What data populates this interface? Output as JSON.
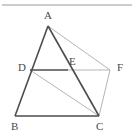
{
  "figure": {
    "canvas": {
      "width": 134,
      "height": 140,
      "background": "#ffffff"
    },
    "colors": {
      "primary_stroke": "#4d4d4d",
      "secondary_stroke": "#b4b4b4",
      "top_rule": "#9a9a9a",
      "label_text": "#4a4a4a"
    },
    "top_rule": {
      "x1": 2,
      "y1": 5,
      "x2": 132,
      "y2": 5
    },
    "points": [
      {
        "id": "A",
        "label": "A",
        "x": 48,
        "y": 26,
        "label_x": 44,
        "label_y": 10
      },
      {
        "id": "B",
        "label": "B",
        "x": 15,
        "y": 116,
        "label_x": 11,
        "label_y": 121
      },
      {
        "id": "C",
        "label": "C",
        "x": 99,
        "y": 116,
        "label_x": 96,
        "label_y": 121
      },
      {
        "id": "D",
        "label": "D",
        "x": 30,
        "y": 70,
        "label_x": 18,
        "label_y": 62
      },
      {
        "id": "E",
        "label": "E",
        "x": 68,
        "y": 70,
        "label_x": 69,
        "label_y": 56
      },
      {
        "id": "F",
        "label": "F",
        "x": 110,
        "y": 70,
        "label_x": 117,
        "label_y": 62
      }
    ],
    "segments": [
      {
        "id": "AB",
        "from": "A",
        "to": "B",
        "style": "primary",
        "width": 1.6
      },
      {
        "id": "AC",
        "from": "A",
        "to": "C",
        "style": "primary",
        "width": 1.6
      },
      {
        "id": "BC",
        "from": "B",
        "to": "C",
        "style": "primary",
        "width": 1.6
      },
      {
        "id": "DE",
        "from": "D",
        "to": "E",
        "style": "primary",
        "width": 1.4
      },
      {
        "id": "AF",
        "from": "A",
        "to": "F",
        "style": "secondary",
        "width": 1
      },
      {
        "id": "EF",
        "from": "E",
        "to": "F",
        "style": "secondary",
        "width": 1
      },
      {
        "id": "DC",
        "from": "D",
        "to": "C",
        "style": "secondary",
        "width": 1
      },
      {
        "id": "CF",
        "from": "C",
        "to": "F",
        "style": "secondary",
        "width": 1
      }
    ]
  }
}
